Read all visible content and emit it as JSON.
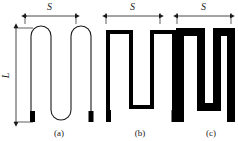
{
  "figure": {
    "type": "technical-line-diagram",
    "background_color": "#ffffff",
    "stroke_color": "#1a1a1a",
    "fill_color": "#000000",
    "panels": [
      {
        "id": "a",
        "caption": "(a)",
        "dimension_width_label": "S",
        "dimension_height_label": "L",
        "trace_style": "thin outline with rounded U-turns",
        "trace_width_px": 1,
        "vertical_arm_count": 4,
        "terminal_pads": 2,
        "terminal_pad_color": "#000000"
      },
      {
        "id": "b",
        "caption": "(b)",
        "dimension_width_label": "S",
        "trace_style": "medium thickness with square corners",
        "trace_width_px": 4,
        "vertical_arm_count": 4,
        "terminal_pads": 2,
        "terminal_pad_color": "#000000"
      },
      {
        "id": "c",
        "caption": "(c)",
        "dimension_width_label": "S",
        "trace_style": "thick solid black with square corners",
        "trace_width_px": 8,
        "vertical_arm_count": 4,
        "terminal_pads": 2,
        "terminal_pad_color": "#000000"
      }
    ],
    "dimension_arrows": {
      "S_a": "S",
      "S_b": "S",
      "S_c": "S",
      "L": "L"
    },
    "captions": {
      "a": "(a)",
      "b": "(b)",
      "c": "(c)"
    }
  }
}
